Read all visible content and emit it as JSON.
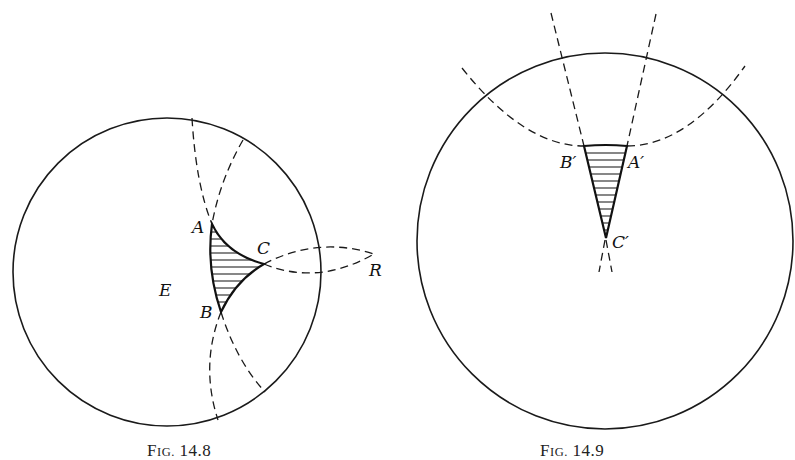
{
  "figures": [
    {
      "id": "fig-14-8",
      "caption": {
        "prefix": "F",
        "smallcaps": "IG.",
        "number": " 14.8"
      },
      "labels": {
        "A": "A",
        "B": "B",
        "C": "C",
        "E": "E",
        "R": "R"
      }
    },
    {
      "id": "fig-14-9",
      "caption": {
        "prefix": "F",
        "smallcaps": "IG.",
        "number": " 14.9"
      },
      "labels": {
        "A": "A′",
        "B": "B′",
        "C": "C′"
      }
    }
  ],
  "colors": {
    "ink": "#1a1a1a",
    "background": "#ffffff"
  }
}
